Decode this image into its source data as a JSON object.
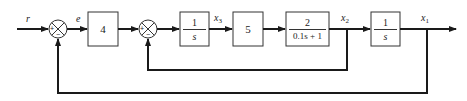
{
  "diagram": {
    "type": "block-diagram",
    "signals": {
      "input": "r",
      "error": "e",
      "x3": {
        "base": "x",
        "sub": "3"
      },
      "x2": {
        "base": "x",
        "sub": "2"
      },
      "x1": {
        "base": "x",
        "sub": "1"
      }
    },
    "blocks": [
      {
        "id": "gain4",
        "type": "gain",
        "value": "4"
      },
      {
        "id": "integrator1",
        "type": "fraction",
        "num": "1",
        "den": "s"
      },
      {
        "id": "gain5",
        "type": "gain",
        "value": "5"
      },
      {
        "id": "firstorder",
        "type": "fraction",
        "num": "2",
        "den": "0.1s + 1"
      },
      {
        "id": "integrator2",
        "type": "fraction",
        "num": "1",
        "den": "s"
      }
    ],
    "summing_junctions": [
      {
        "id": "sum1",
        "plus": "+",
        "minus": "−"
      },
      {
        "id": "sum2",
        "plus": "+",
        "minus": "−"
      }
    ],
    "connections": [
      "r → sum1(+)",
      "sum1 → e → gain4",
      "gain4 → sum2(+)",
      "sum2 → integrator1 (1/s)",
      "integrator1 → x3 → gain5",
      "gain5 → firstorder (2/(0.1s+1))",
      "firstorder → x2 → integrator2 (1/s)",
      "integrator2 → x1 → output",
      "x2 → sum2(−) [inner feedback]",
      "x1 → sum1(−) [outer feedback]"
    ],
    "colors": {
      "line": "#1a1a1a",
      "background": "#ffffff"
    }
  }
}
